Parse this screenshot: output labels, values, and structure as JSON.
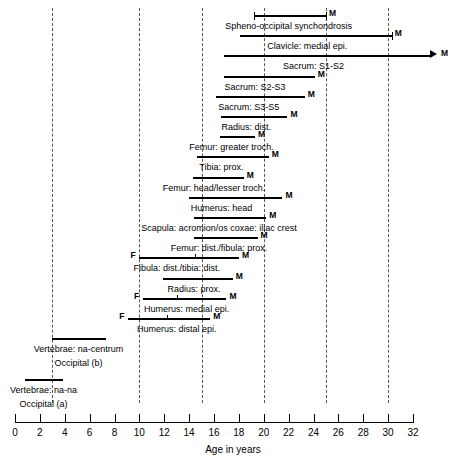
{
  "chart_data": {
    "type": "bar",
    "orientation": "horizontal-range",
    "title": "",
    "xlabel": "Age in years",
    "ylabel": "",
    "xlim": [
      0,
      32
    ],
    "xticks": [
      0,
      2,
      4,
      6,
      8,
      10,
      12,
      14,
      16,
      18,
      20,
      22,
      24,
      26,
      28,
      30,
      32
    ],
    "xticklabels": [
      "0",
      "2",
      "4",
      "6",
      "8",
      "10",
      "12",
      "14",
      "16",
      "18",
      "20",
      "22",
      "24",
      "26",
      "28",
      "30",
      "32"
    ],
    "grid": true,
    "gridlines": [
      3,
      10,
      15,
      20,
      25,
      30
    ],
    "legend": "",
    "annotations": [
      "M denotes male range end",
      "F denotes female range start"
    ],
    "series": [
      {
        "name": "Spheno-occipital synchondrosis",
        "start": 19.2,
        "end": 25.0,
        "start_mark": "",
        "end_mark": "M",
        "start_tick": true,
        "end_tick": true,
        "arrow": false,
        "label_center": 22.0
      },
      {
        "name": "Clavicle: medial epi.",
        "start": 18.1,
        "end": 30.3,
        "start_mark": "",
        "end_mark": "M",
        "start_tick": false,
        "end_tick": true,
        "arrow": false,
        "label_center": 23.5
      },
      {
        "name": "Sacrum: S1-S2",
        "start": 16.8,
        "end": 34.0,
        "start_mark": "",
        "end_mark": "M",
        "start_tick": false,
        "end_tick": false,
        "arrow": true,
        "label_center": 24.0
      },
      {
        "name": "Sacrum: S2-S3",
        "start": 16.8,
        "end": 24.1,
        "start_mark": "",
        "end_mark": "M",
        "start_tick": false,
        "end_tick": false,
        "arrow": false,
        "label_center": 19.3
      },
      {
        "name": "Sacrum: S3-S5",
        "start": 16.2,
        "end": 23.3,
        "start_mark": "",
        "end_mark": "M",
        "start_tick": false,
        "end_tick": false,
        "arrow": false,
        "label_center": 18.8
      },
      {
        "name": "Radius: dist.",
        "start": 16.6,
        "end": 21.9,
        "start_mark": "",
        "end_mark": "M",
        "start_tick": false,
        "end_tick": false,
        "arrow": false,
        "label_center": 18.6
      },
      {
        "name": "Femur: greater troch.",
        "start": 16.5,
        "end": 19.3,
        "start_mark": "",
        "end_mark": "M",
        "start_tick": false,
        "end_tick": false,
        "arrow": false,
        "label_center": 17.4
      },
      {
        "name": "Tibia: prox.",
        "start": 14.6,
        "end": 20.4,
        "start_mark": "",
        "end_mark": "M",
        "start_tick": false,
        "end_tick": false,
        "arrow": false,
        "label_center": 16.6
      },
      {
        "name": "Femur: head/lesser troch.",
        "start": 14.3,
        "end": 18.4,
        "start_mark": "",
        "end_mark": "M",
        "start_tick": false,
        "end_tick": false,
        "arrow": false,
        "label_center": 16.0
      },
      {
        "name": "Humerus: head",
        "start": 14.0,
        "end": 21.5,
        "start_mark": "",
        "end_mark": "M",
        "start_tick": false,
        "end_tick": false,
        "arrow": false,
        "label_center": 16.6
      },
      {
        "name": "Scapula: acromion/os coxae: iliac crest",
        "start": 14.4,
        "end": 20.2,
        "start_mark": "",
        "end_mark": "M",
        "start_tick": false,
        "end_tick": false,
        "arrow": false,
        "label_center": 16.4
      },
      {
        "name": "Femur: dist./fibula: prox.",
        "start": 14.4,
        "end": 19.5,
        "start_mark": "",
        "end_mark": "M",
        "start_tick": false,
        "end_tick": false,
        "arrow": false,
        "label_center": 16.4
      },
      {
        "name": "Fibula: dist./tibia: dist.",
        "start": 10.0,
        "end": 18.0,
        "start_mark": "F",
        "end_mark": "M",
        "start_tick": false,
        "end_tick": false,
        "arrow": false,
        "label_center": 13.0,
        "split": 14.5
      },
      {
        "name": "Radius: prox.",
        "start": 11.9,
        "end": 17.5,
        "start_mark": "",
        "end_mark": "M",
        "start_tick": false,
        "end_tick": false,
        "arrow": false,
        "label_center": 14.4
      },
      {
        "name": "Humerus: medial epi.",
        "start": 10.3,
        "end": 17.0,
        "start_mark": "F",
        "end_mark": "M",
        "start_tick": false,
        "end_tick": false,
        "arrow": false,
        "label_center": 13.8,
        "split": 13.0
      },
      {
        "name": "Humerus: distal epi.",
        "start": 9.1,
        "end": 15.7,
        "start_mark": "F",
        "end_mark": "M",
        "start_tick": false,
        "end_tick": false,
        "arrow": false,
        "label_center": 13.0,
        "split": 12.2
      },
      {
        "name": "Vertebrae: na-centrum",
        "start": 3.0,
        "end": 7.3,
        "start_mark": "",
        "end_mark": "",
        "start_tick": false,
        "end_tick": false,
        "arrow": false,
        "label_center": 5.1
      },
      {
        "name": "Occipital (b)",
        "start": null,
        "end": null,
        "start_mark": "",
        "end_mark": "",
        "start_tick": false,
        "end_tick": false,
        "arrow": false,
        "label_center": 5.1,
        "label_only": true
      },
      {
        "name": "Vertebrae: na-na",
        "start": 0.8,
        "end": 3.9,
        "start_mark": "",
        "end_mark": "",
        "start_tick": false,
        "end_tick": false,
        "arrow": false,
        "label_center": 2.3
      },
      {
        "name": "Occipital (a)",
        "start": null,
        "end": null,
        "start_mark": "",
        "end_mark": "",
        "start_tick": false,
        "end_tick": false,
        "arrow": false,
        "label_center": 2.3,
        "label_only": true
      }
    ]
  },
  "style": {
    "bar_color": "#000000",
    "grid_color": "#555555",
    "text_color": "#000000",
    "background": "#ffffff"
  }
}
